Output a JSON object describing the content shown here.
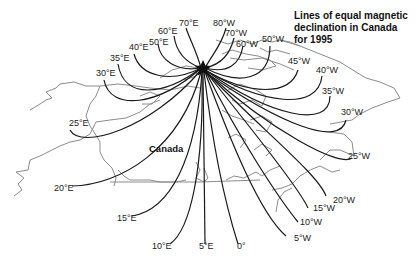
{
  "title_lines": [
    "Lines of equal magnetic",
    "declination in Canada",
    "for 1995"
  ],
  "country_label": "Canada",
  "pole_marker": "star",
  "colors": {
    "isogonic_lines": "#1a1a1a",
    "coastline": "#8c8c8c",
    "background": "#ffffff"
  },
  "east_labels": [
    "70°E",
    "60°E",
    "50°E",
    "40°E",
    "35°E",
    "30°E",
    "25°E",
    "20°E",
    "15°E",
    "10°E",
    "5°E"
  ],
  "zero_label": "0°",
  "west_labels": [
    "80°W",
    "70°W",
    "60°W",
    "50°W",
    "45°W",
    "40°W",
    "35°W",
    "30°W",
    "25°W",
    "20°W",
    "15°W",
    "10°W",
    "5°W"
  ]
}
